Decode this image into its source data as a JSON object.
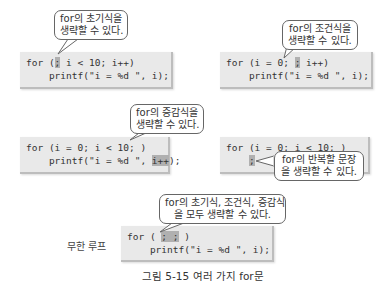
{
  "panels": [
    {
      "bubble": [
        "for의 초기식을",
        "생략할 수 있다."
      ],
      "code": {
        "line1_pre": "for (",
        "line1_hl": ";",
        "line1_post": " i < 10; i++)",
        "line2_pre": "    printf(\"i = %d \", i);",
        "line2_hl": "",
        "line2_post": ""
      }
    },
    {
      "bubble": [
        "for의 조건식을",
        "생략할 수 있다."
      ],
      "code": {
        "line1_pre": "for (i = 0; ",
        "line1_hl": ";",
        "line1_post": " i++)",
        "line2_pre": "    printf(\"i = %d \", i);",
        "line2_hl": "",
        "line2_post": ""
      }
    },
    {
      "bubble": [
        "for의 증감식을",
        "생략할 수 있다."
      ],
      "code": {
        "line1_pre": "for (i = 0; i < 10; )",
        "line1_hl": "",
        "line1_post": "",
        "line2_pre": "    printf(\"i = %d \", ",
        "line2_hl": "i++",
        "line2_post": ");"
      }
    },
    {
      "bubble": [
        "for의 반복할 문장",
        "을 생략할 수 있다."
      ],
      "code": {
        "line1_pre": "for (i = 0; i < 10; )",
        "line1_hl": "",
        "line1_post": "",
        "line2_pre": "    ",
        "line2_hl": ";",
        "line2_post": ""
      }
    },
    {
      "label": "무한 루프",
      "bubble": [
        "for의 초기식, 조건식, 증감식",
        "을 모두 생략할 수 있다."
      ],
      "code": {
        "line1_pre": "for ( ",
        "line1_hl": "; ;",
        "line1_post": " )",
        "line2_pre": "    printf(\"i = %d \", i);",
        "line2_hl": "",
        "line2_post": ""
      }
    }
  ],
  "caption": "그림 5-15 여러 가지 for문"
}
